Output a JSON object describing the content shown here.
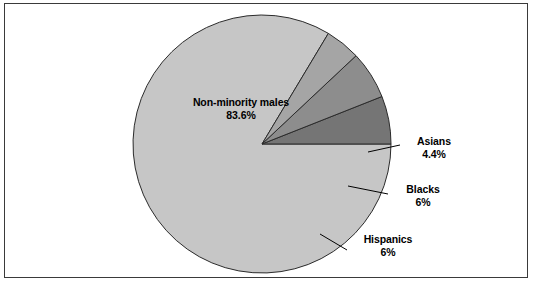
{
  "chart_data": {
    "type": "pie",
    "title": "",
    "subtitle": "",
    "xlabel": "",
    "ylabel": "",
    "legend_position": "none",
    "labels_position": "callout",
    "start_angle_deg": 0,
    "direction": "clockwise",
    "categories": [
      "Non-minority males",
      "Asians",
      "Blacks",
      "Hispanics"
    ],
    "values": [
      83.6,
      4.4,
      6,
      6
    ],
    "value_labels": [
      "83.6%",
      "4.4%",
      "6%",
      "6%"
    ],
    "colors": [
      "#c6c6c6",
      "#a5a5a5",
      "#8d8d8d",
      "#757575"
    ],
    "slices": [
      {
        "name": "Non-minority males",
        "value": 83.6,
        "value_label": "83.6%",
        "color": "#c6c6c6",
        "label_placement": "inside"
      },
      {
        "name": "Asians",
        "value": 4.4,
        "value_label": "4.4%",
        "color": "#a5a5a5",
        "label_placement": "callout-right"
      },
      {
        "name": "Blacks",
        "value": 6,
        "value_label": "6%",
        "color": "#8d8d8d",
        "label_placement": "callout-right"
      },
      {
        "name": "Hispanics",
        "value": 6,
        "value_label": "6%",
        "color": "#757575",
        "label_placement": "callout-right"
      }
    ]
  },
  "figure": {
    "frame_color": "#3a3a3a",
    "background_color": "#ffffff",
    "outline_color": "#000000",
    "leader_line_color": "#000000"
  }
}
